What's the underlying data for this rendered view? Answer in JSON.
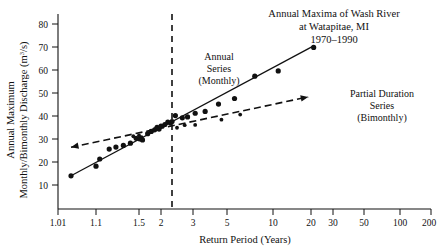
{
  "chart_data": {
    "type": "scatter",
    "title": "Annual Maxima of Wash River\nat Watapitae, MI\n1970–1990",
    "title_lines": [
      "Annual Maxima of Wash River",
      "at Watapitae, MI",
      "1970–1990"
    ],
    "xlabel": "Return Period (Years)",
    "ylabel_lines": [
      "Annual Maximum",
      "Monthly/Bimonthly Discharge (m³/s)"
    ],
    "ylabel": "Annual Maximum Monthly/Bimonthly Discharge (m3/s)",
    "y_units": "m³/s",
    "xscale": "gumbel-probability (return period)",
    "xticks": [
      "1.01",
      "1.1",
      "1.5",
      "2",
      "3",
      "5",
      "10",
      "20",
      "30",
      "50",
      "100",
      "200"
    ],
    "xtick_values": [
      1.01,
      1.1,
      1.5,
      2,
      3,
      5,
      10,
      20,
      30,
      50,
      100,
      200
    ],
    "yticks": [
      "10",
      "20",
      "30",
      "40",
      "50",
      "60",
      "70",
      "80"
    ],
    "ytick_values": [
      10,
      20,
      30,
      40,
      50,
      60,
      70,
      80
    ],
    "ylim": [
      0,
      85
    ],
    "grid": false,
    "legend": "none (inline annotations)",
    "annotations": [
      {
        "name": "annual-series-label",
        "lines": [
          "Annual",
          "Series",
          "(Monthly)"
        ]
      },
      {
        "name": "partial-duration-series-label",
        "lines": [
          "Partial Duration",
          "Series",
          "(Bimonthly)"
        ]
      }
    ],
    "reference_line": {
      "name": "vertical-dashed-reference",
      "x_value": 2.3,
      "style": "dashed"
    },
    "series": [
      {
        "name": "Annual Series (Monthly)",
        "marker": "filled circle",
        "fit": "solid straight line",
        "fit_endpoints": [
          {
            "x": 1.04,
            "y": 14.0
          },
          {
            "x": 21.0,
            "y": 70.5
          }
        ],
        "points": [
          {
            "x": 1.04,
            "y": 14.0
          },
          {
            "x": 1.1,
            "y": 18.2
          },
          {
            "x": 1.13,
            "y": 21.3
          },
          {
            "x": 1.21,
            "y": 25.6
          },
          {
            "x": 1.27,
            "y": 26.5
          },
          {
            "x": 1.34,
            "y": 27.2
          },
          {
            "x": 1.41,
            "y": 28.2
          },
          {
            "x": 1.47,
            "y": 30.3
          },
          {
            "x": 1.52,
            "y": 30.0
          },
          {
            "x": 1.57,
            "y": 29.6
          },
          {
            "x": 1.68,
            "y": 32.3
          },
          {
            "x": 1.76,
            "y": 33.3
          },
          {
            "x": 1.84,
            "y": 34.0
          },
          {
            "x": 1.9,
            "y": 35.1
          },
          {
            "x": 1.95,
            "y": 34.3
          },
          {
            "x": 2.0,
            "y": 35.6
          },
          {
            "x": 2.1,
            "y": 36.3
          },
          {
            "x": 2.18,
            "y": 37.3
          },
          {
            "x": 2.3,
            "y": 37.6
          },
          {
            "x": 2.4,
            "y": 40.2
          },
          {
            "x": 2.62,
            "y": 39.2
          },
          {
            "x": 2.8,
            "y": 39.6
          },
          {
            "x": 3.1,
            "y": 41.2
          },
          {
            "x": 3.6,
            "y": 42.0
          },
          {
            "x": 4.4,
            "y": 45.2
          },
          {
            "x": 5.6,
            "y": 47.6
          },
          {
            "x": 7.6,
            "y": 57.3
          },
          {
            "x": 11.0,
            "y": 59.6
          },
          {
            "x": 21.0,
            "y": 69.8
          }
        ]
      },
      {
        "name": "Partial Duration Series (Bimonthly)",
        "marker": "small filled circle",
        "fit": "dashed line with arrowheads at both ends",
        "fit_endpoints": [
          {
            "x": 1.04,
            "y": 26.4
          },
          {
            "x": 19.0,
            "y": 48.3
          }
        ],
        "points": [
          {
            "x": 1.44,
            "y": 31.2
          },
          {
            "x": 1.5,
            "y": 31.6
          },
          {
            "x": 1.55,
            "y": 30.8
          },
          {
            "x": 1.88,
            "y": 34.6
          },
          {
            "x": 2.05,
            "y": 35.4
          },
          {
            "x": 2.25,
            "y": 36.6
          },
          {
            "x": 2.45,
            "y": 34.9
          },
          {
            "x": 2.7,
            "y": 36.0
          },
          {
            "x": 3.1,
            "y": 36.1
          },
          {
            "x": 4.6,
            "y": 38.4
          },
          {
            "x": 6.1,
            "y": 40.6
          }
        ]
      }
    ]
  }
}
